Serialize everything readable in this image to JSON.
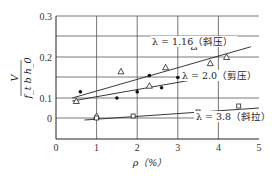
{
  "chart_data": {
    "type": "scatter",
    "title": "",
    "xlabel": "ρ（%）",
    "ylabel": "V / (f_t b h_0)",
    "ylabel_num": "V",
    "ylabel_den": "f_t b h_0",
    "xlim": [
      0,
      5
    ],
    "x_ticks": [
      "0",
      "1",
      "2",
      "3",
      "4",
      "5"
    ],
    "y_ticks": [
      "0.3",
      "0.2",
      "0.1",
      "0"
    ],
    "grid": true,
    "series": [
      {
        "name": "λ = 1.16（斜压）",
        "marker": "triangle",
        "points": [
          [
            0.5,
            0.085
          ],
          [
            1.0,
            0.01
          ],
          [
            1.6,
            0.165
          ],
          [
            2.3,
            0.13
          ],
          [
            2.7,
            0.175
          ],
          [
            3.4,
            0.225
          ],
          [
            3.8,
            0.185
          ],
          [
            4.2,
            0.2
          ]
        ],
        "fit_line": [
          [
            0.4,
            0.1
          ],
          [
            4.8,
            0.225
          ]
        ]
      },
      {
        "name": "λ = 2.0（剪压）",
        "marker": "dot",
        "points": [
          [
            0.6,
            0.115
          ],
          [
            1.5,
            0.1
          ],
          [
            2.0,
            0.115
          ],
          [
            2.3,
            0.155
          ],
          [
            2.6,
            0.125
          ],
          [
            3.0,
            0.15
          ]
        ],
        "fit_line": [
          [
            0.4,
            0.085
          ],
          [
            3.4,
            0.145
          ]
        ]
      },
      {
        "name": "λ = 3.8（斜拉）",
        "marker": "square",
        "points": [
          [
            1.0,
            0.0
          ],
          [
            1.9,
            0.01
          ],
          [
            3.5,
            0.03
          ],
          [
            4.5,
            0.06
          ]
        ],
        "fit_line": [
          [
            0.7,
            -0.01
          ],
          [
            5.0,
            0.05
          ]
        ]
      }
    ],
    "annotations": [
      {
        "text": "λ = 1.16（斜压）",
        "series": 0
      },
      {
        "text": "λ = 2.0（剪压）",
        "series": 1
      },
      {
        "text": "λ = 3.8（斜拉）",
        "series": 2
      }
    ]
  }
}
